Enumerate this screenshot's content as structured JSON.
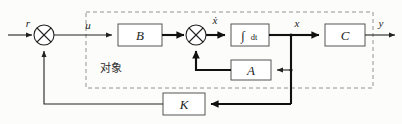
{
  "diagram": {
    "type": "control-block-diagram",
    "colors": {
      "line": "#222222",
      "thick_line": "#111111",
      "block_stroke": "#555555",
      "block_fill": "#ffffff",
      "dashed_box": "#777777",
      "background": "#fcfcfb"
    },
    "plant_label": "对象",
    "blocks": [
      {
        "id": "B",
        "label": "B",
        "x": 118,
        "y": 24,
        "w": 44,
        "h": 22
      },
      {
        "id": "INT",
        "label": "∫dt",
        "integrand": "∫",
        "differential": "dt",
        "x": 231,
        "y": 24,
        "w": 38,
        "h": 22
      },
      {
        "id": "C",
        "label": "C",
        "x": 325,
        "y": 24,
        "w": 40,
        "h": 22
      },
      {
        "id": "A",
        "label": "A",
        "x": 231,
        "y": 60,
        "w": 40,
        "h": 20
      },
      {
        "id": "K",
        "label": "K",
        "x": 163,
        "y": 93,
        "w": 42,
        "h": 22
      }
    ],
    "summing_junctions": [
      {
        "id": "sum1",
        "cx": 44,
        "cy": 35,
        "r": 10,
        "style": "crossed-circle"
      },
      {
        "id": "sum2",
        "cx": 196,
        "cy": 35,
        "r": 10,
        "style": "crossed-circle"
      }
    ],
    "signals": [
      {
        "id": "r",
        "label": "r",
        "x": 28,
        "y": 27
      },
      {
        "id": "u",
        "label": "u",
        "x": 88,
        "y": 28
      },
      {
        "id": "xdot",
        "label": "ẋ",
        "x": 213,
        "y": 22
      },
      {
        "id": "x",
        "label": "x",
        "x": 296,
        "y": 27
      },
      {
        "id": "y",
        "label": "y",
        "x": 380,
        "y": 27
      }
    ],
    "dashed_boundary": {
      "x": 86,
      "y": 12,
      "w": 287,
      "h": 76
    }
  }
}
